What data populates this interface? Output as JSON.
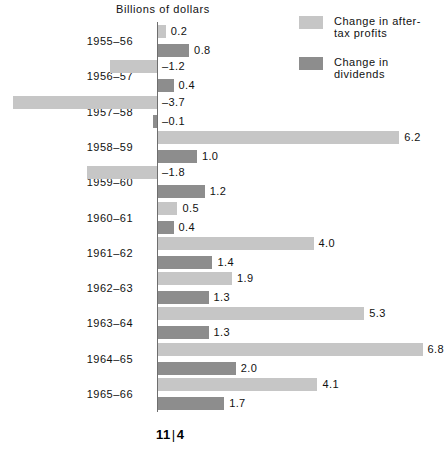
{
  "chart_data": {
    "type": "bar",
    "orientation": "horizontal",
    "title": "Billions of dollars",
    "xlabel": "Billions of dollars",
    "ylabel": "",
    "grid": false,
    "legend_position": "top-right",
    "zero_axis": true,
    "xlim": [
      -3.7,
      6.8
    ],
    "categories": [
      "1955–56",
      "1956–57",
      "1957–58",
      "1958–59",
      "1959–60",
      "1960–61",
      "1961–62",
      "1962–63",
      "1963–64",
      "1964–65",
      "1965–66"
    ],
    "series": [
      {
        "name": "Change in after-tax profits",
        "color": "#c6c6c6",
        "values": [
          0.2,
          -1.2,
          -3.7,
          6.2,
          -1.8,
          0.5,
          4.0,
          1.9,
          5.3,
          6.8,
          4.1
        ],
        "labels": [
          "0.2",
          "–1.2",
          "–3.7",
          "6.2",
          "–1.8",
          "0.5",
          "4.0",
          "1.9",
          "5.3",
          "6.8",
          "4.1"
        ]
      },
      {
        "name": "Change in dividends",
        "color": "#8d8d8d",
        "values": [
          0.8,
          0.4,
          -0.1,
          1.0,
          1.2,
          0.4,
          1.4,
          1.3,
          1.3,
          2.0,
          1.7
        ],
        "labels": [
          "0.8",
          "0.4",
          "–0.1",
          "1.0",
          "1.2",
          "0.4",
          "1.4",
          "1.3",
          "1.3",
          "2.0",
          "1.7"
        ]
      }
    ]
  },
  "legend": {
    "items": [
      {
        "label": "Change in after-tax profits",
        "color": "#c6c6c6",
        "swatch": "profits"
      },
      {
        "label": "Change in dividends",
        "color": "#8d8d8d",
        "swatch": "dividends"
      }
    ]
  },
  "footer": {
    "page_number": "11",
    "divider": "|",
    "section_number": "4"
  }
}
